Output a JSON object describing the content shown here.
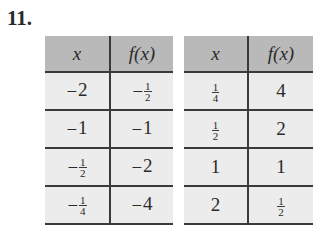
{
  "problem": {
    "number": "11."
  },
  "tables": [
    {
      "headers": [
        "x",
        "f(x)"
      ],
      "rows": [
        [
          {
            "sign": "−",
            "whole": "2"
          },
          {
            "sign": "−",
            "num": "1",
            "den": "2"
          }
        ],
        [
          {
            "sign": "−",
            "whole": "1"
          },
          {
            "sign": "−",
            "whole": "1"
          }
        ],
        [
          {
            "sign": "−",
            "num": "1",
            "den": "2"
          },
          {
            "sign": "−",
            "whole": "2"
          }
        ],
        [
          {
            "sign": "−",
            "num": "1",
            "den": "4"
          },
          {
            "sign": "−",
            "whole": "4"
          }
        ]
      ]
    },
    {
      "headers": [
        "x",
        "f(x)"
      ],
      "rows": [
        [
          {
            "sign": "",
            "num": "1",
            "den": "4"
          },
          {
            "sign": "",
            "whole": "4"
          }
        ],
        [
          {
            "sign": "",
            "num": "1",
            "den": "2"
          },
          {
            "sign": "",
            "whole": "2"
          }
        ],
        [
          {
            "sign": "",
            "whole": "1"
          },
          {
            "sign": "",
            "whole": "1"
          }
        ],
        [
          {
            "sign": "",
            "whole": "2"
          },
          {
            "sign": "",
            "num": "1",
            "den": "2"
          }
        ]
      ]
    }
  ],
  "colors": {
    "header_bg": "#b9b9b9",
    "cell_bg": "#ececec",
    "rule": "#3a3a3a"
  }
}
